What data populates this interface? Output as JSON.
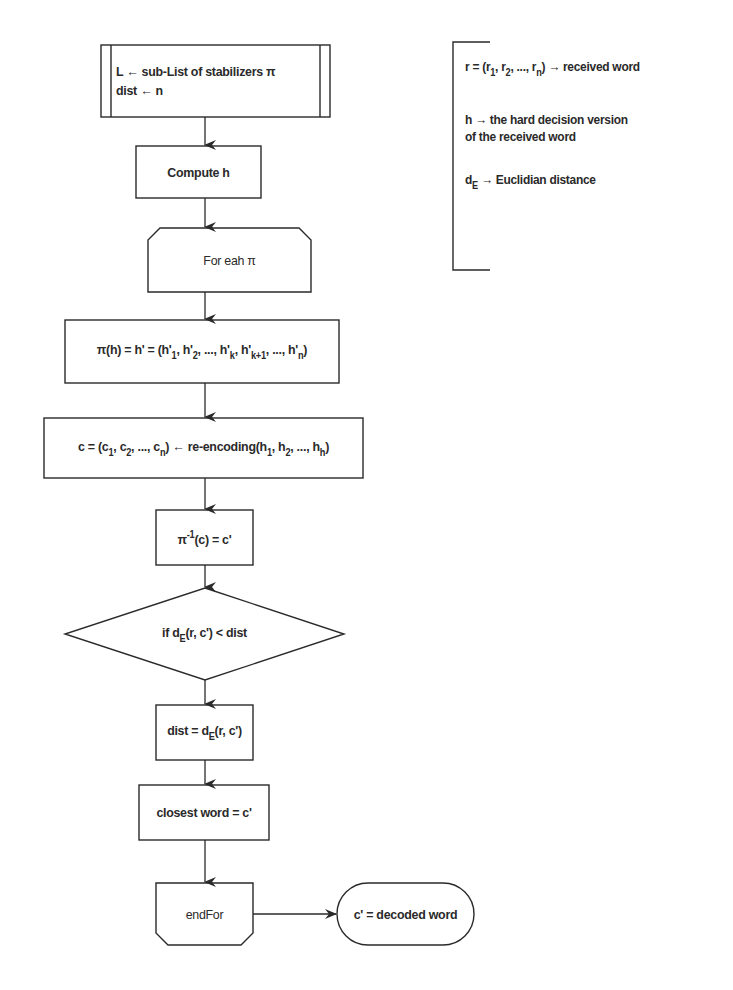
{
  "diagram": {
    "type": "flowchart",
    "nodes": {
      "init": {
        "shape": "predefined-process",
        "line1": "L ← sub-List of stabilizers π",
        "line2": "dist ← n"
      },
      "compute_h": {
        "shape": "process",
        "label": "Compute h"
      },
      "for_each": {
        "shape": "loop-start",
        "label": "For eah π"
      },
      "permute": {
        "shape": "process",
        "prefix": "π(h) = h' = (h'",
        "parts": [
          "1",
          ", h'",
          "2",
          ", ..., h'",
          "k",
          ", h'",
          "k+1",
          ", ..., h'",
          "n",
          ")"
        ]
      },
      "reencode": {
        "shape": "process",
        "prefix": "c = (c",
        "parts": [
          "1",
          ", c",
          "2",
          ", ..., c",
          "n",
          ") ← re-encoding(h",
          "1",
          ", h",
          "2",
          ", ..., h",
          "h",
          ")"
        ]
      },
      "inverse": {
        "shape": "process",
        "base": "π",
        "sup": "-1",
        "rest": "(c) = c'"
      },
      "decision": {
        "shape": "decision",
        "prefix": "if d",
        "sub": "E",
        "rest": "(r, c') < dist"
      },
      "update_dist": {
        "shape": "process",
        "prefix": "dist = d",
        "sub": "E",
        "rest": "(r, c')"
      },
      "closest": {
        "shape": "process",
        "label": "closest word = c'"
      },
      "end_for": {
        "shape": "loop-end",
        "label": "endFor"
      },
      "result": {
        "shape": "terminal",
        "label": "c' = decoded word"
      }
    },
    "edges": [
      [
        "init",
        "compute_h"
      ],
      [
        "compute_h",
        "for_each"
      ],
      [
        "for_each",
        "permute"
      ],
      [
        "permute",
        "reencode"
      ],
      [
        "reencode",
        "inverse"
      ],
      [
        "inverse",
        "decision"
      ],
      [
        "decision",
        "update_dist"
      ],
      [
        "update_dist",
        "closest"
      ],
      [
        "closest",
        "end_for"
      ],
      [
        "end_for",
        "result"
      ]
    ],
    "legend": {
      "r_def": {
        "prefix": "r = (r",
        "parts": [
          "1",
          ", r",
          "2",
          ", ..., r",
          "n",
          ")"
        ],
        "suffix": " → received word"
      },
      "h_def": {
        "line1": "h → the hard decision version",
        "line2": "of the received word"
      },
      "dE_def": {
        "prefix": "d",
        "sub": "E",
        "suffix": " → Euclidian distance"
      }
    },
    "colors": {
      "stroke": "#2a2a2a",
      "background": "#ffffff",
      "text": "#2a2a2a"
    }
  }
}
